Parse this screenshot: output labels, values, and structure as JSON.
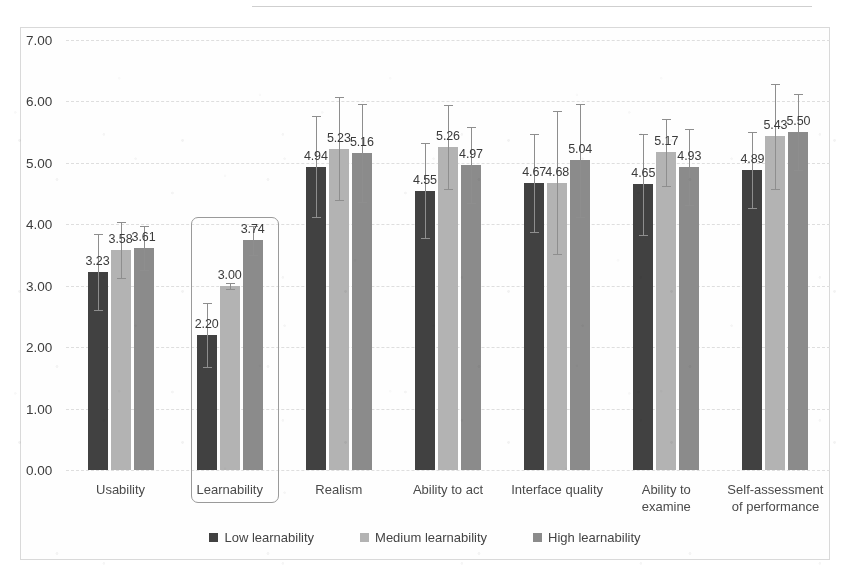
{
  "chart_data": {
    "type": "bar",
    "title": "",
    "subtitle": "",
    "xlabel": "",
    "ylabel": "",
    "ylim": [
      0,
      7
    ],
    "ytick_step": 1,
    "ytick_labels": [
      "0.00",
      "1.00",
      "2.00",
      "3.00",
      "4.00",
      "5.00",
      "6.00",
      "7.00"
    ],
    "grid": true,
    "legend_position": "bottom-center",
    "categories": [
      "Usability",
      "Learnability",
      "Realism",
      "Ability to act",
      "Interface quality",
      "Ability to\nexamine",
      "Self-assessment\nof performance"
    ],
    "highlighted_category": "Learnability",
    "series": [
      {
        "name": "Low learnability",
        "color": "#414141",
        "values": [
          3.23,
          2.2,
          4.94,
          4.55,
          4.67,
          4.65,
          4.89
        ],
        "errors": [
          0.62,
          0.52,
          0.82,
          0.78,
          0.8,
          0.82,
          0.62
        ]
      },
      {
        "name": "Medium learnability",
        "color": "#b3b3b3",
        "values": [
          3.58,
          3.0,
          5.23,
          5.26,
          4.68,
          5.17,
          5.43
        ],
        "errors": [
          0.46,
          0.05,
          0.84,
          0.68,
          1.16,
          0.54,
          0.86
        ]
      },
      {
        "name": "High learnability",
        "color": "#8b8b8b",
        "values": [
          3.61,
          3.74,
          5.16,
          4.97,
          5.04,
          4.93,
          5.5
        ],
        "errors": [
          0.36,
          0.24,
          0.8,
          0.62,
          0.92,
          0.62,
          0.62
        ]
      }
    ],
    "data_labels": [
      [
        "3.23",
        "3.58",
        "3.61"
      ],
      [
        "2.20",
        "3.00",
        "3.74"
      ],
      [
        "4.94",
        "5.23",
        "5.16"
      ],
      [
        "4.55",
        "5.26",
        "4.97"
      ],
      [
        "4.67",
        "4.68",
        "5.04"
      ],
      [
        "4.65",
        "5.17",
        "4.93"
      ],
      [
        "4.89",
        "5.43",
        "5.50"
      ]
    ]
  },
  "legend": {
    "items": [
      {
        "label": "Low learnability"
      },
      {
        "label": "Medium learnability"
      },
      {
        "label": "High learnability"
      }
    ]
  }
}
